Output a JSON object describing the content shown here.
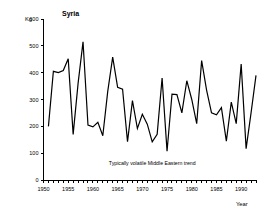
{
  "chart_data": {
    "type": "line",
    "title": "Syria",
    "xlabel": "Year",
    "ylabel": "Kg",
    "ylim": [
      0,
      600
    ],
    "xlim": [
      1950,
      1993
    ],
    "grid": false,
    "legend": null,
    "ytick_labels": [
      "0",
      "100",
      "200",
      "300",
      "400",
      "500",
      "600"
    ],
    "ytick_values": [
      0,
      100,
      200,
      300,
      400,
      500,
      600
    ],
    "xtick_labels": [
      "1950",
      "1955",
      "1960",
      "1965",
      "1970",
      "1975",
      "1980",
      "1985",
      "1990"
    ],
    "xtick_values": [
      1950,
      1955,
      1960,
      1965,
      1970,
      1975,
      1980,
      1985,
      1990
    ],
    "minor_xticks_every": 1,
    "annotations": [
      {
        "text": "Typically volatile Middle Eastern trend",
        "x": 1972,
        "y": 55
      }
    ],
    "x": [
      1951,
      1952,
      1953,
      1954,
      1955,
      1956,
      1957,
      1958,
      1959,
      1960,
      1961,
      1962,
      1963,
      1964,
      1965,
      1966,
      1967,
      1968,
      1969,
      1970,
      1971,
      1972,
      1973,
      1974,
      1975,
      1976,
      1977,
      1978,
      1979,
      1980,
      1981,
      1982,
      1983,
      1984,
      1985,
      1986,
      1987,
      1988,
      1989,
      1990,
      1991,
      1992,
      1993
    ],
    "values": [
      200,
      405,
      400,
      408,
      452,
      170,
      360,
      515,
      205,
      198,
      215,
      165,
      330,
      458,
      345,
      338,
      143,
      296,
      192,
      245,
      208,
      142,
      170,
      380,
      107,
      320,
      318,
      250,
      370,
      300,
      210,
      445,
      335,
      250,
      243,
      270,
      145,
      290,
      210,
      432,
      117,
      250,
      390
    ],
    "series_color": "#000000",
    "background_color": "#ffffff"
  },
  "layout": {
    "title_position": "top-center-left",
    "ylabel_position": "top-left-of-axis",
    "xlabel_position": "bottom-right"
  }
}
